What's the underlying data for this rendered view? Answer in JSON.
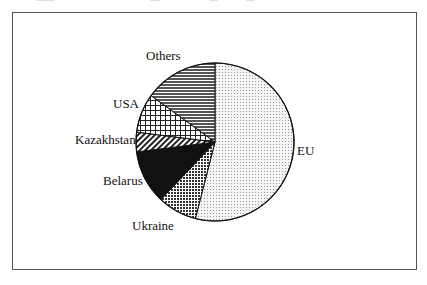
{
  "chart_data": {
    "type": "pie",
    "title": "",
    "start_angle_deg": 0,
    "direction": "clockwise",
    "slices": [
      {
        "label": "EU",
        "value": 54,
        "pattern": "fine-dots"
      },
      {
        "label": "Ukraine",
        "value": 8,
        "pattern": "checker-dense"
      },
      {
        "label": "Belarus",
        "value": 11,
        "pattern": "solid-dark"
      },
      {
        "label": "Kazakhstan",
        "value": 4,
        "pattern": "diagonal-hatch"
      },
      {
        "label": "USA",
        "value": 8,
        "pattern": "grid"
      },
      {
        "label": "Others",
        "value": 15,
        "pattern": "horizontal-lines"
      }
    ],
    "legend": "none (direct labels)",
    "grid": false
  },
  "labels": {
    "eu": "EU",
    "ukraine": "Ukraine",
    "belarus": "Belarus",
    "kazakhstan": "Kazakhstan",
    "usa": "USA",
    "others": "Others"
  }
}
